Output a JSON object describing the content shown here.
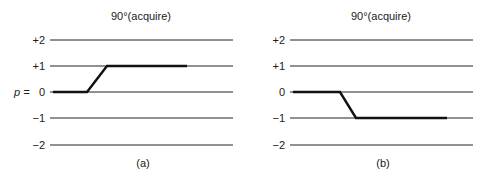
{
  "panels": [
    {
      "id": "a",
      "title": "90°(acquire)",
      "caption": "(a)",
      "axis_label": "p =",
      "levels": [
        "+2",
        "+1",
        "0",
        "−1",
        "−2"
      ],
      "path_description": "coherence pathway from p = 0 to p = +1",
      "start_level": 0,
      "end_level": 1
    },
    {
      "id": "b",
      "title": "90°(acquire)",
      "caption": "(b)",
      "axis_label": "",
      "levels": [
        "+2",
        "+1",
        "0",
        "−1",
        "−2"
      ],
      "path_description": "coherence pathway from p = 0 to p = −1",
      "start_level": 0,
      "end_level": -1
    }
  ],
  "colors": {
    "line": "#222222",
    "path": "#111111",
    "text": "#1a1a1a"
  }
}
